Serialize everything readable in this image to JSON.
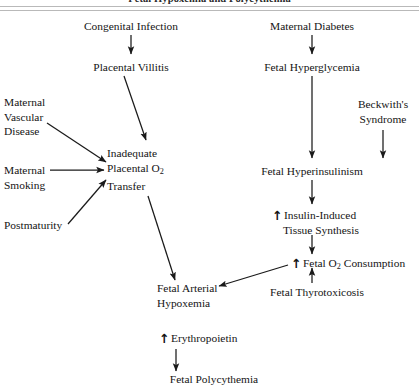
{
  "figure": {
    "title": "Fetal Hypoxemia and Polycythemia",
    "background": "#ffffff",
    "line_color": "#1a1a1a",
    "rule_color": "#b9b9b9",
    "width": 419,
    "height": 386
  },
  "nodes": {
    "congenital_infection": "Congenital Infection",
    "placental_villitis": "Placental Villitis",
    "maternal_vascular_disease_l1": "Maternal",
    "maternal_vascular_disease_l2": "Vascular",
    "maternal_vascular_disease_l3": "Disease",
    "maternal_smoking_l1": "Maternal",
    "maternal_smoking_l2": "Smoking",
    "postmaturity": "Postmaturity",
    "inadequate_transfer_l1": "Inadequate",
    "inadequate_transfer_l2_pre": "Placental O",
    "inadequate_transfer_l2_sub": "2",
    "inadequate_transfer_l3": "Transfer",
    "maternal_diabetes": "Maternal Diabetes",
    "fetal_hyperglycemia": "Fetal Hyperglycemia",
    "beckwiths_syndrome_l1": "Beckwith's",
    "beckwiths_syndrome_l2": "Syndrome",
    "fetal_hyperinsulinism": "Fetal Hyperinsulinism",
    "insulin_induced_arrow": "↑",
    "insulin_induced_l1": "Insulin-Induced",
    "insulin_induced_l2": "Tissue Synthesis",
    "fetal_o2_consumption_arrow": "↑",
    "fetal_o2_consumption_pre": "Fetal O",
    "fetal_o2_consumption_sub": "2",
    "fetal_o2_consumption_post": " Consumption",
    "fetal_thyrotoxicosis": "Fetal Thyrotoxicosis",
    "fetal_arterial_hypoxemia_l1": "Fetal Arterial",
    "fetal_arterial_hypoxemia_l2": "Hypoxemia",
    "erythropoietin_arrow": "↑",
    "erythropoietin": "Erythropoietin",
    "fetal_polycythemia": "Fetal Polycythemia"
  }
}
